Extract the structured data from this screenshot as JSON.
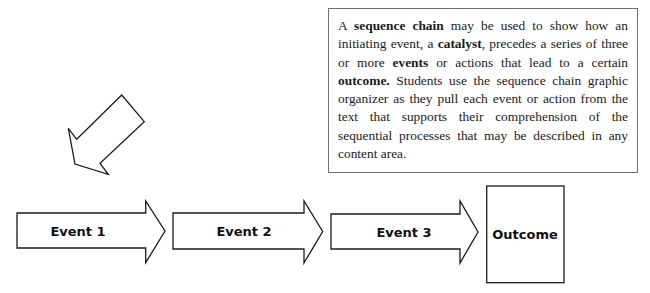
{
  "description": {
    "segments": [
      {
        "text": "A ",
        "bold": false
      },
      {
        "text": "sequence chain",
        "bold": true
      },
      {
        "text": " may be used to show how an initiating event, a ",
        "bold": false
      },
      {
        "text": "catalyst",
        "bold": true
      },
      {
        "text": ", precedes a series of three or more ",
        "bold": false
      },
      {
        "text": "events",
        "bold": true
      },
      {
        "text": " or actions that lead to a certain ",
        "bold": false
      },
      {
        "text": "outcome.",
        "bold": true
      },
      {
        "text": " Students use the sequence chain graphic organizer as they pull each event or action from the text that supports their comprehension of the sequential processes that may be described in any content area.",
        "bold": false
      }
    ]
  },
  "diagram": {
    "catalyst_arrow": {
      "label": "",
      "direction": "down-left"
    },
    "events": [
      {
        "label": "Event 1"
      },
      {
        "label": "Event 2"
      },
      {
        "label": "Event 3"
      }
    ],
    "outcome": {
      "label": "Outcome"
    },
    "stroke_color": "#1a1a1a",
    "fill_color": "#ffffff"
  }
}
